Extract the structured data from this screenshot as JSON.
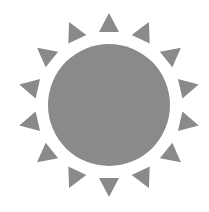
{
  "icon": {
    "name": "sun-icon",
    "fill": "#8a8a8a",
    "background": "#ffffff",
    "center": [
      109,
      105
    ],
    "disc_radius": 61,
    "ray_count": 14,
    "ray_inner_radius": 73,
    "ray_outer_radius": 92,
    "ray_half_width": 10
  }
}
